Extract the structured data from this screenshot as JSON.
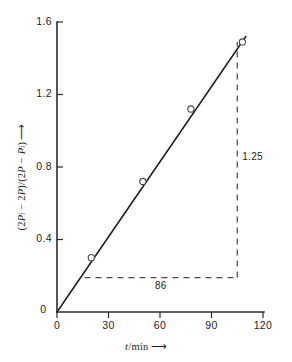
{
  "chart_data": {
    "type": "scatter",
    "title": "",
    "subtitle": "",
    "xlabel": "t/min",
    "ylabel": "(2P_i - 2P)/(2P - P_i)",
    "xlabel_display": "t/min ⟶",
    "ylabel_display": "(2Pᵢ − 2P)/(2P − Pᵢ) ⟶",
    "x": [
      20,
      50,
      78,
      108
    ],
    "values": [
      0.3,
      0.72,
      1.12,
      1.49
    ],
    "series": [
      {
        "name": "experimental points",
        "x": [
          20,
          50,
          78,
          108
        ],
        "values": [
          0.3,
          0.72,
          1.12,
          1.49
        ]
      }
    ],
    "fit_line": {
      "x": [
        0,
        110
      ],
      "values": [
        0.0,
        1.52
      ],
      "slope": 0.01453,
      "intercept": 0.0
    },
    "xlim": [
      0,
      120
    ],
    "ylim": [
      0,
      1.6
    ],
    "xticks": [
      0,
      30,
      60,
      90,
      120
    ],
    "yticks": [
      0,
      0.4,
      0.8,
      1.2,
      1.6
    ],
    "xtick_labels": [
      "0",
      "30",
      "60",
      "90",
      "120"
    ],
    "ytick_labels": [
      "0",
      "0.4",
      "0.8",
      "1.2",
      "1.6"
    ],
    "grid": false,
    "legend": "none",
    "marker": "open-circle",
    "annotations": [
      {
        "name": "run",
        "label": "86",
        "orientation": "horizontal",
        "from_x": 16,
        "to_x": 105,
        "at_y": 0.19
      },
      {
        "name": "rise",
        "label": "1.25",
        "orientation": "vertical",
        "at_x": 105,
        "from_y": 0.19,
        "to_y": 1.49
      }
    ],
    "origin_label": "0",
    "colors": {
      "axis": "#2b2b2b",
      "line": "#1c1c1c",
      "marker_edge": "#4a4a4a",
      "marker_fill": "#ffffff",
      "guide": "#4d4d4d",
      "text": "#262626",
      "background": "#ffffff"
    }
  }
}
